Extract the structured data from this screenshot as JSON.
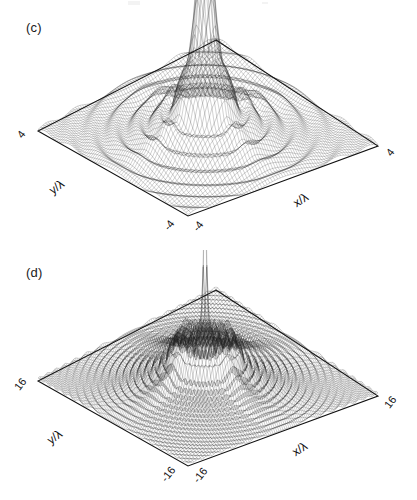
{
  "figure": {
    "panels": [
      {
        "id": "c",
        "label": "(c)",
        "axis_x_title": "x/λ",
        "axis_y_title": "y/λ",
        "tick_left_top": "4",
        "tick_right": "4",
        "tick_bottom_left": "-4",
        "tick_bottom_right": "-4"
      },
      {
        "id": "d",
        "label": "(d)",
        "axis_x_title": "x/λ",
        "axis_y_title": "y/λ",
        "tick_left_top": "16",
        "tick_right": "16",
        "tick_bottom_left": "-16",
        "tick_bottom_right": "-16"
      }
    ]
  },
  "chart_data": [
    {
      "type": "surface",
      "panel": "c",
      "title": "(c)",
      "xlabel": "x/λ",
      "ylabel": "y/λ",
      "xlim": [
        -4,
        4
      ],
      "ylim": [
        -4,
        4
      ],
      "xticks": [
        -4,
        4
      ],
      "yticks": [
        -4,
        4
      ],
      "grid": false,
      "legend": null,
      "projection": "3d wireframe mesh, viewed from elevated oblique angle",
      "description": "Axially symmetric diffraction-like intensity surface: a single tall narrow central cone rising from a rippled plateau, surrounded by concentric oscillating rings that decay toward the flat outer base. Four dark caustic ridges radiate diagonally outward from the central peak region.",
      "features": {
        "central_peak_height_normalized": 1.0,
        "central_peak_half_width_lambda": 0.45,
        "ring_count_visible": 5,
        "plateau_level_normalized": 0.18,
        "baseline_level_normalized": 0.02,
        "caustic_ridge_count": 4
      },
      "radial_profile": {
        "r_over_lambda": [
          0.0,
          0.2,
          0.4,
          0.6,
          0.8,
          1.0,
          1.2,
          1.4,
          1.6,
          1.8,
          2.0,
          2.4,
          2.8,
          3.2,
          3.6,
          4.0
        ],
        "intensity_normalized": [
          1.0,
          0.82,
          0.46,
          0.2,
          0.22,
          0.28,
          0.19,
          0.1,
          0.12,
          0.14,
          0.09,
          0.06,
          0.05,
          0.035,
          0.025,
          0.02
        ]
      },
      "mesh": {
        "nx": 72,
        "ny": 72
      }
    },
    {
      "type": "surface",
      "panel": "d",
      "title": "(d)",
      "xlabel": "x/λ",
      "ylabel": "y/λ",
      "xlim": [
        -16,
        16
      ],
      "ylim": [
        -16,
        16
      ],
      "xticks": [
        -16,
        16
      ],
      "yticks": [
        -16,
        16
      ],
      "grid": false,
      "legend": null,
      "projection": "3d wireframe mesh, viewed from elevated oblique angle",
      "description": "Same axially symmetric field over a four-times wider aperture: an extremely narrow needle-like spike at the center sits on a broad raised annular plateau with a sharp rim, surrounded by many fine concentric oscillation rings decaying to a flat base. Dense dark caustic filaments radiate diagonally from the plateau rim.",
      "features": {
        "central_peak_height_normalized": 1.0,
        "central_peak_half_width_lambda": 0.25,
        "ring_count_visible": 12,
        "plateau_level_normalized": 0.34,
        "plateau_radius_lambda": 4.5,
        "baseline_level_normalized": 0.02,
        "caustic_ridge_count": 4
      },
      "radial_profile": {
        "r_over_lambda": [
          0.0,
          0.5,
          1.0,
          1.5,
          2.0,
          3.0,
          4.0,
          4.5,
          5.0,
          6.0,
          7.0,
          8.0,
          10.0,
          12.0,
          14.0,
          16.0
        ],
        "intensity_normalized": [
          1.0,
          0.52,
          0.33,
          0.3,
          0.32,
          0.34,
          0.33,
          0.3,
          0.2,
          0.14,
          0.11,
          0.09,
          0.06,
          0.04,
          0.028,
          0.02
        ]
      },
      "mesh": {
        "nx": 96,
        "ny": 96
      }
    }
  ]
}
